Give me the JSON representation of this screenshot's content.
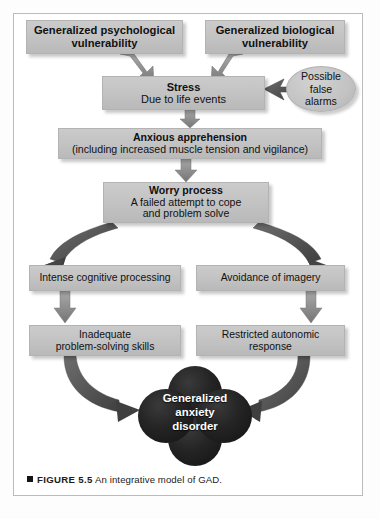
{
  "figure": {
    "caption_marker": "■",
    "caption_label": "FIGURE 5.5",
    "caption_text": "An integrative model of GAD."
  },
  "palette": {
    "box_fill": "#c4c4c4",
    "box_border": "#b3b3b3",
    "oval_fill": "#c3c3c3",
    "arrow_gray": "#8c8c8c",
    "arrow_dark": "#4f4f4f",
    "clover_fill": "#1c1c1c",
    "clover_text": "#ffffff",
    "frame_border": "#b9bcbd",
    "page_bg": "#ffffff"
  },
  "nodes": {
    "psychological_vulnerability": {
      "line1": "Generalized psychological",
      "line2": "vulnerability"
    },
    "biological_vulnerability": {
      "line1": "Generalized biological",
      "line2": "vulnerability"
    },
    "stress": {
      "line1": "Stress",
      "line2": "Due to life events"
    },
    "false_alarms": {
      "line1": "Possible",
      "line2": "false",
      "line3": "alarms"
    },
    "anxious_apprehension": {
      "line1": "Anxious apprehension",
      "line2": "(including increased muscle tension and vigilance)"
    },
    "worry_process": {
      "line1": "Worry process",
      "line2": "A failed attempt to cope",
      "line3": "and problem solve"
    },
    "intense_cognitive_processing": {
      "line1": "Intense cognitive processing"
    },
    "avoidance_of_imagery": {
      "line1": "Avoidance of imagery"
    },
    "inadequate_problem_solving": {
      "line1": "Inadequate",
      "line2": "problem-solving skills"
    },
    "restricted_autonomic_response": {
      "line1": "Restricted autonomic",
      "line2": "response"
    },
    "generalized_anxiety_disorder": {
      "line1": "Generalized",
      "line2": "anxiety",
      "line3": "disorder"
    }
  },
  "edges": [
    {
      "id": "psych-to-stress",
      "from": "psychological_vulnerability",
      "to": "stress",
      "style": "straight-arrow"
    },
    {
      "id": "bio-to-stress",
      "from": "biological_vulnerability",
      "to": "stress",
      "style": "straight-arrow"
    },
    {
      "id": "falsealarms-to-stress",
      "from": "false_alarms",
      "to": "stress",
      "style": "straight-arrow"
    },
    {
      "id": "stress-to-anxious",
      "from": "stress",
      "to": "anxious_apprehension",
      "style": "straight-arrow"
    },
    {
      "id": "anxious-to-worry",
      "from": "anxious_apprehension",
      "to": "worry_process",
      "style": "straight-arrow"
    },
    {
      "id": "worry-to-intense",
      "from": "worry_process",
      "to": "intense_cognitive_processing",
      "style": "curved-arrow"
    },
    {
      "id": "worry-to-avoidance",
      "from": "worry_process",
      "to": "avoidance_of_imagery",
      "style": "curved-arrow"
    },
    {
      "id": "intense-to-inadequate",
      "from": "intense_cognitive_processing",
      "to": "inadequate_problem_solving",
      "style": "straight-arrow"
    },
    {
      "id": "avoidance-to-restricted",
      "from": "avoidance_of_imagery",
      "to": "restricted_autonomic_response",
      "style": "straight-arrow"
    },
    {
      "id": "inadequate-to-gad",
      "from": "inadequate_problem_solving",
      "to": "generalized_anxiety_disorder",
      "style": "curved-arrow"
    },
    {
      "id": "restricted-to-gad",
      "from": "restricted_autonomic_response",
      "to": "generalized_anxiety_disorder",
      "style": "curved-arrow"
    }
  ]
}
